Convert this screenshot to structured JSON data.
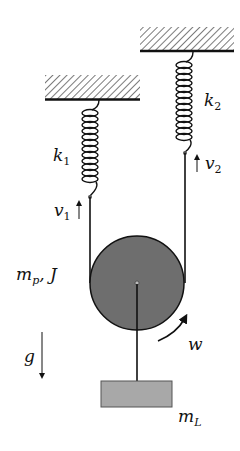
{
  "diagram": {
    "labels": {
      "k1": {
        "base": "k",
        "sub": "1"
      },
      "k2": {
        "base": "k",
        "sub": "2"
      },
      "v1": {
        "base": "v",
        "sub": "1"
      },
      "v2": {
        "base": "v",
        "sub": "2"
      },
      "pulley": {
        "base": "m",
        "sub": "p",
        "suffix": ", J"
      },
      "gravity": "g",
      "omega": "w",
      "load": {
        "base": "m",
        "sub": "L"
      }
    },
    "colors": {
      "pulley_fill": "#6e6e6e",
      "block_fill": "#a8a8a8",
      "line": "#111111",
      "background": "#ffffff"
    }
  }
}
